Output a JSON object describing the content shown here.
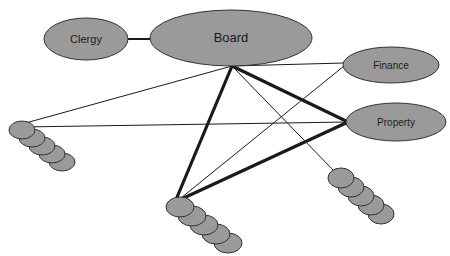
{
  "diagram": {
    "type": "node-link-network",
    "canvas": {
      "width": 450,
      "height": 256,
      "background": "#ffffff"
    },
    "style": {
      "node_fill": "#9a9a9a",
      "node_stroke": "#333333",
      "node_stroke_width": 1,
      "cluster_fill": "#9a9a9a",
      "cluster_stroke": "#333333",
      "edge_color": "#1a1a1a",
      "label_color": "#1a1a1a",
      "label_font_size": 11
    },
    "nodes": [
      {
        "id": "clergy",
        "label": "Clergy",
        "shape": "ellipse",
        "cx": 86,
        "cy": 39,
        "rx": 42,
        "ry": 21,
        "font_size": 11
      },
      {
        "id": "board",
        "label": "Board",
        "shape": "ellipse",
        "cx": 231,
        "cy": 38,
        "rx": 81,
        "ry": 28,
        "font_size": 13
      },
      {
        "id": "finance",
        "label": "Finance",
        "shape": "ellipse",
        "cx": 391,
        "cy": 65,
        "rx": 48,
        "ry": 18,
        "font_size": 10
      },
      {
        "id": "property",
        "label": "Property",
        "shape": "ellipse",
        "cx": 396,
        "cy": 122,
        "rx": 50,
        "ry": 19,
        "font_size": 10
      }
    ],
    "clusters": [
      {
        "id": "cluster-left",
        "label": "",
        "count": 5,
        "anchor_x": 22,
        "anchor_y": 124,
        "start_cx": 22,
        "start_cy": 130,
        "step_x": 10,
        "step_y": 8,
        "rx": 13,
        "ry": 9
      },
      {
        "id": "cluster-bottom",
        "label": "",
        "count": 5,
        "anchor_x": 175,
        "anchor_y": 202,
        "start_cx": 180,
        "start_cy": 207,
        "step_x": 12,
        "step_y": 9,
        "rx": 14,
        "ry": 10
      },
      {
        "id": "cluster-right",
        "label": "",
        "count": 5,
        "anchor_x": 335,
        "anchor_y": 172,
        "start_cx": 341,
        "start_cy": 178,
        "step_x": 10,
        "step_y": 9,
        "rx": 13,
        "ry": 10
      }
    ],
    "edges": [
      {
        "id": "edge-clergy-board",
        "from": "clergy",
        "to": "board",
        "x1": 128,
        "y1": 39,
        "x2": 152,
        "y2": 39,
        "weight": 2.2
      },
      {
        "id": "edge-board-finance",
        "from": "board",
        "to": "finance",
        "x1": 232,
        "y1": 66,
        "x2": 344,
        "y2": 63,
        "weight": 1.0
      },
      {
        "id": "edge-board-property",
        "from": "board",
        "to": "property",
        "x1": 232,
        "y1": 66,
        "x2": 348,
        "y2": 122,
        "weight": 3.2
      },
      {
        "id": "edge-board-cluster-bottom",
        "from": "board",
        "to": "cluster-bottom",
        "x1": 232,
        "y1": 66,
        "x2": 175,
        "y2": 202,
        "weight": 3.2
      },
      {
        "id": "edge-board-cluster-left",
        "from": "board",
        "to": "cluster-left",
        "x1": 232,
        "y1": 66,
        "x2": 22,
        "y2": 124,
        "weight": 1.0
      },
      {
        "id": "edge-board-cluster-right",
        "from": "board",
        "to": "cluster-right",
        "x1": 232,
        "y1": 66,
        "x2": 335,
        "y2": 172,
        "weight": 1.0
      },
      {
        "id": "edge-property-cluster-left",
        "from": "property",
        "to": "cluster-left",
        "x1": 348,
        "y1": 122,
        "x2": 22,
        "y2": 127,
        "weight": 1.0
      },
      {
        "id": "edge-property-cluster-bottom",
        "from": "property",
        "to": "cluster-bottom",
        "x1": 348,
        "y1": 122,
        "x2": 175,
        "y2": 202,
        "weight": 3.2
      },
      {
        "id": "edge-finance-cluster-bottom",
        "from": "finance",
        "to": "cluster-bottom",
        "x1": 344,
        "y1": 66,
        "x2": 176,
        "y2": 202,
        "weight": 1.0
      }
    ]
  }
}
